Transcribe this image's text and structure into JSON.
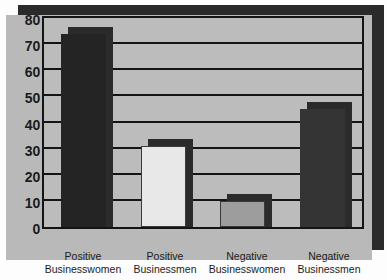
{
  "chart_data": {
    "type": "bar",
    "title": "",
    "subtitle": "",
    "xlabel": "",
    "ylabel": "",
    "categories": [
      "Positive Businesswomen",
      "Positive Businessmen",
      "Negative Businesswomen",
      "Negative Businessmen"
    ],
    "category_lines": [
      [
        "Positive",
        "Businesswomen"
      ],
      [
        "Positive",
        "Businessmen"
      ],
      [
        "Negative",
        "Businesswomen"
      ],
      [
        "Negative",
        "Businessmen"
      ]
    ],
    "values": [
      74,
      31,
      10,
      45
    ],
    "bar_colors": [
      "#242424",
      "#e8e8e8",
      "#9d9d9d",
      "#343434"
    ],
    "ylim": [
      0,
      80
    ],
    "yticks": [
      0,
      10,
      20,
      30,
      40,
      50,
      60,
      70,
      80
    ],
    "ytick_labels": [
      "0",
      "10",
      "20",
      "30",
      "40",
      "50",
      "60",
      "70",
      "80"
    ],
    "grid": true,
    "legend": "none",
    "style": {
      "panel_color": "#b9b9b9",
      "plot_background": "#bcbcbc",
      "gridline_color": "#141414",
      "axis_color": "#141414",
      "shadow_color": "#2a2a2a",
      "text_color": "#1b1b1b"
    }
  }
}
